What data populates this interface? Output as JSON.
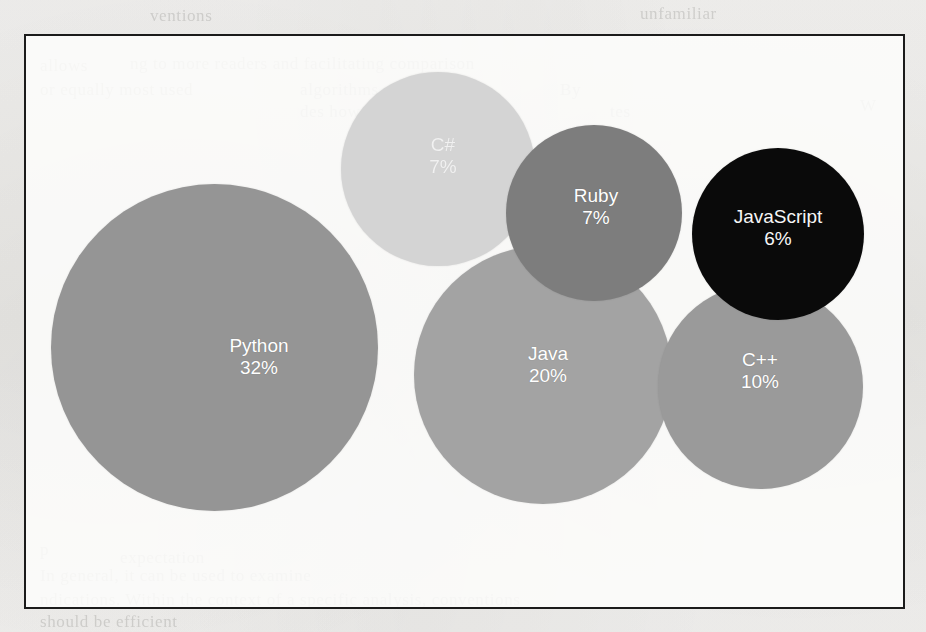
{
  "page": {
    "background_color": "#f2f1ef",
    "frame_color": "#1b1b1b",
    "bleed_through_lines": [
      {
        "text": "ventions",
        "x": 150,
        "y": 6
      },
      {
        "text": "unfamiliar",
        "x": 640,
        "y": 4
      },
      {
        "text": "allows",
        "x": 40,
        "y": 56
      },
      {
        "text": "ng to more readers and facilitating comparison",
        "x": 130,
        "y": 54
      },
      {
        "text": "or equally most used",
        "x": 40,
        "y": 80
      },
      {
        "text": "algorithms. It pro-",
        "x": 300,
        "y": 80
      },
      {
        "text": "By",
        "x": 560,
        "y": 80
      },
      {
        "text": "des how the context of the",
        "x": 300,
        "y": 102
      },
      {
        "text": "tes",
        "x": 610,
        "y": 102
      },
      {
        "text": "W",
        "x": 860,
        "y": 96
      },
      {
        "text": "p",
        "x": 40,
        "y": 540
      },
      {
        "text": "expectation",
        "x": 120,
        "y": 548
      },
      {
        "text": "In general, it can be used to examine",
        "x": 40,
        "y": 566
      },
      {
        "text": "ndications. Within the context of a specific analysis, conventions",
        "x": 40,
        "y": 590
      },
      {
        "text": "should be efficient",
        "x": 40,
        "y": 612
      }
    ]
  },
  "chart_data": {
    "type": "bubble",
    "title": "",
    "subtitle": "",
    "xlabel": "",
    "ylabel": "",
    "legend": "none",
    "grid": false,
    "axes_visible": false,
    "value_unit": "%",
    "categories": [
      "Python",
      "Java",
      "C++",
      "C#",
      "Ruby",
      "JavaScript"
    ],
    "values": [
      32,
      20,
      10,
      7,
      7,
      6
    ],
    "points": [
      {
        "label": "Python",
        "value": 32,
        "value_text": "32%",
        "color": "#959595",
        "cx": 212,
        "cy": 345,
        "diameter": 327,
        "label_dx": 45,
        "label_dy": 10
      },
      {
        "label": "Java",
        "value": 20,
        "value_text": "20%",
        "color": "#a3a3a3",
        "cx": 541,
        "cy": 373,
        "diameter": 258,
        "label_dx": 5,
        "label_dy": -10
      },
      {
        "label": "C++",
        "value": 10,
        "value_text": "10%",
        "color": "#9a9a9a",
        "cx": 758,
        "cy": 384,
        "diameter": 205,
        "label_dx": 0,
        "label_dy": -15
      },
      {
        "label": "C#",
        "value": 7,
        "value_text": "7%",
        "color": "#d4d4d4",
        "cx": 436,
        "cy": 167,
        "diameter": 194,
        "label_dx": 5,
        "label_dy": -13
      },
      {
        "label": "Ruby",
        "value": 7,
        "value_text": "7%",
        "color": "#7d7d7d",
        "cx": 592,
        "cy": 211,
        "diameter": 176,
        "label_dx": 2,
        "label_dy": -6
      },
      {
        "label": "JavaScript",
        "value": 6,
        "value_text": "6%",
        "color": "#0a0a0a",
        "cx": 776,
        "cy": 232,
        "diameter": 172,
        "label_dx": 0,
        "label_dy": -6
      }
    ],
    "draw_order": [
      "Python",
      "C#",
      "Java",
      "C++",
      "Ruby",
      "JavaScript"
    ]
  }
}
